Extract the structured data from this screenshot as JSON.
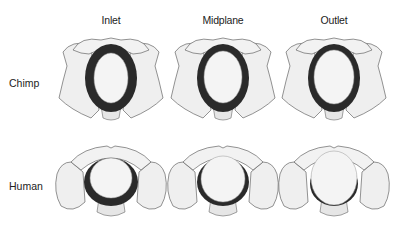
{
  "columns": [
    {
      "label": "Inlet",
      "x": 111
    },
    {
      "label": "Midplane",
      "x": 223
    },
    {
      "label": "Outlet",
      "x": 334
    }
  ],
  "rows": [
    {
      "label": "Chimp",
      "y": 83
    },
    {
      "label": "Human",
      "y": 186
    }
  ],
  "figures": [
    {
      "species": "chimp",
      "plane": "inlet",
      "head_rx": 17,
      "head_ry": 25
    },
    {
      "species": "chimp",
      "plane": "midplane",
      "head_rx": 19,
      "head_ry": 26
    },
    {
      "species": "chimp",
      "plane": "outlet",
      "head_rx": 20,
      "head_ry": 27
    },
    {
      "species": "human",
      "plane": "inlet",
      "head_rx": 21,
      "head_ry": 20
    },
    {
      "species": "human",
      "plane": "midplane",
      "head_rx": 22,
      "head_ry": 23
    },
    {
      "species": "human",
      "plane": "outlet",
      "head_rx": 23,
      "head_ry": 27
    }
  ],
  "colors": {
    "canal": "#2a2a2a",
    "bone": "#efefef",
    "bone_stroke": "#666666",
    "head": "#f4f4f4"
  }
}
